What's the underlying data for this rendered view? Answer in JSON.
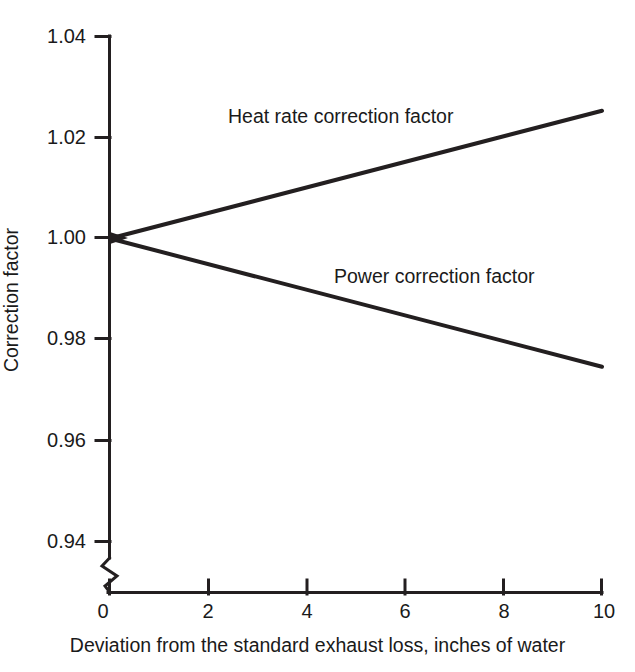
{
  "chart_data": {
    "type": "line",
    "title": "",
    "xlabel": "Deviation from the standard exhaust loss, inches of water",
    "ylabel": "Correction factor",
    "xlim": [
      0,
      10
    ],
    "ylim": [
      0.94,
      1.04
    ],
    "xticks": [
      0,
      2,
      4,
      6,
      8,
      10
    ],
    "yticks": [
      0.94,
      0.96,
      0.98,
      1.0,
      1.02,
      1.04
    ],
    "xtick_labels": [
      "0",
      "2",
      "4",
      "6",
      "8",
      "10"
    ],
    "ytick_labels": [
      "0.94",
      "0.96",
      "0.98",
      "1.00",
      "1.02",
      "1.04"
    ],
    "grid": false,
    "legend_position": "inline-annotation",
    "y_axis_break": true,
    "series": [
      {
        "name": "Heat rate correction factor",
        "color": "#231f20",
        "x": [
          0,
          10
        ],
        "values": [
          1.0,
          1.0253
        ],
        "annotation": "Heat rate correction factor"
      },
      {
        "name": "Power correction factor",
        "color": "#231f20",
        "x": [
          0,
          10
        ],
        "values": [
          1.0,
          0.9746
        ],
        "annotation": "Power correction factor"
      }
    ]
  },
  "axes": {
    "y_title": "Correction factor",
    "x_title": "Deviation from the standard exhaust loss, inches of water",
    "y_tick_labels": [
      "1.04",
      "1.02",
      "1.00",
      "0.98",
      "0.96",
      "0.94"
    ],
    "x_tick_labels": [
      "0",
      "2",
      "4",
      "6",
      "8",
      "10"
    ]
  },
  "annotations": {
    "heat_rate": "Heat rate correction factor",
    "power": "Power correction factor"
  },
  "style": {
    "line_color": "#231f20",
    "axis_color": "#231f20",
    "background": "#ffffff"
  }
}
